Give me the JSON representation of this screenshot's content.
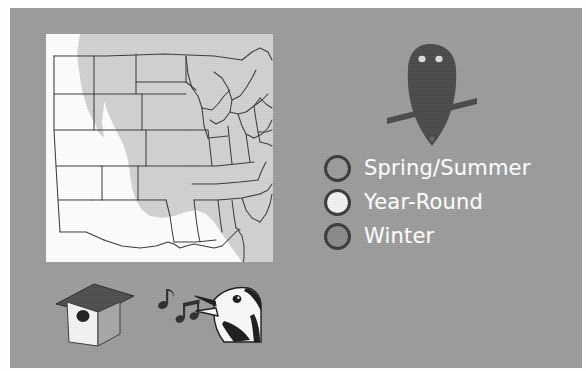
{
  "slide": {
    "background_color": "#9c9c9c",
    "border_color": "#fdfdfd"
  },
  "map": {
    "name": "eastern-united-states-range-map",
    "background_color": "#ffffff",
    "state_outline_color": "#3a3a3a",
    "range_shading_color": "#d0d0d0",
    "description": "Outline map of the central and eastern United States with a shaded range region covering the eastern states"
  },
  "owl": {
    "name": "owl-silhouette",
    "body_color": "#4a4a4a",
    "eye_color": "#d8d8d8",
    "branch_color": "#4a4a4a"
  },
  "legend": {
    "items": [
      {
        "label": "Spring/Summer",
        "swatch_fill": "#9c9c9c",
        "swatch_stroke": "#3b3b3b"
      },
      {
        "label": "Year-Round",
        "swatch_fill": "#f2f2ef",
        "swatch_stroke": "#3b3b3b"
      },
      {
        "label": "Winter",
        "swatch_fill": "#8a8a8a",
        "swatch_stroke": "#3b3b3b"
      }
    ],
    "text_color": "#ffffff"
  },
  "birdhouse": {
    "name": "birdhouse",
    "roof_color": "#4e4e4e",
    "front_color": "#f4f4f2",
    "side_color": "#a8a8a8",
    "hole_color": "#1f1f1f"
  },
  "music_notes": {
    "name": "music-notes",
    "color": "#2e2e2e",
    "count": 2
  },
  "singing_bird": {
    "name": "singing-bird-head",
    "outline_color": "#1c1c1c",
    "body_color": "#fafafa",
    "accent_color": "#202020",
    "description": "Head of a singing bird with open beak"
  }
}
